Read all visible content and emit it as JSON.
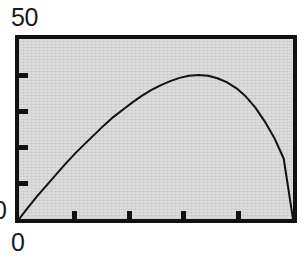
{
  "figure": {
    "background_color": "#ffffff",
    "plot_background_color": "#dcdcdc",
    "frame_color": "#111111",
    "curve_color": "#111111"
  },
  "labels": {
    "y_max": "50",
    "y_min": "0",
    "x_min": "0"
  },
  "chart_data": {
    "type": "line",
    "title": "",
    "xlabel": "",
    "ylabel": "",
    "xlim": [
      0,
      5
    ],
    "ylim": [
      0,
      50
    ],
    "grid": false,
    "legend": null,
    "x_tick_labels": [
      "0"
    ],
    "y_tick_labels": [
      "0",
      "50"
    ],
    "x_ticks": [
      1,
      2,
      3,
      4
    ],
    "y_ticks": [
      10,
      20,
      30,
      40
    ],
    "series": [
      {
        "name": "curve",
        "x": [
          0.0,
          0.17,
          0.34,
          0.52,
          0.69,
          0.86,
          1.03,
          1.21,
          1.38,
          1.55,
          1.72,
          1.9,
          2.07,
          2.24,
          2.41,
          2.59,
          2.76,
          2.93,
          3.1,
          3.28,
          3.45,
          3.62,
          3.79,
          3.97,
          4.14,
          4.31,
          4.48,
          4.66,
          4.83,
          5.0
        ],
        "y": [
          0.0,
          3.3,
          6.5,
          9.6,
          12.6,
          15.5,
          18.3,
          21.0,
          23.5,
          26.0,
          28.3,
          30.4,
          32.4,
          34.2,
          35.8,
          37.2,
          38.3,
          39.2,
          39.8,
          40.0,
          39.8,
          39.1,
          38.0,
          36.3,
          34.0,
          31.0,
          27.2,
          22.5,
          16.8,
          0.0
        ]
      }
    ],
    "annotations": []
  }
}
